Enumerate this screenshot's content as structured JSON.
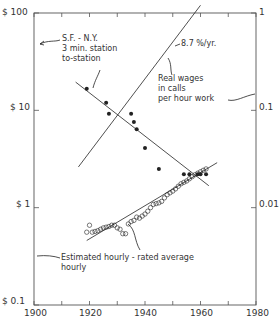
{
  "chart_data": {
    "type": "scatter",
    "title": "",
    "xlabel": "",
    "ylabel": "",
    "xlim": [
      1900,
      1980
    ],
    "ylim": [
      0.1,
      100
    ],
    "yscale": "log",
    "grid": false,
    "x_ticks": [
      1900,
      1920,
      1940,
      1960,
      1980
    ],
    "x_tick_labels": [
      "1900",
      "1920",
      "1940",
      "1960",
      "1980"
    ],
    "y_left_ticks": [
      0.1,
      1,
      10,
      100
    ],
    "y_left_tick_labels": [
      "$ 0.1",
      "$ 1",
      "$ 10",
      "$ 100"
    ],
    "y_right_ticks": [
      0.01,
      0.1,
      1
    ],
    "y_right_tick_labels": [
      "0.01",
      "0.1",
      "1"
    ],
    "y_right_note": "Right axis = left axis / 100 (real wages in calls per hour work)",
    "series": [
      {
        "name": "S.F. - N.Y. 3 min. station to-station",
        "marker": "filled-circle",
        "axis": "left",
        "points": [
          [
            1919,
            16.7
          ],
          [
            1926,
            12.0
          ],
          [
            1927,
            9.2
          ],
          [
            1935,
            9.2
          ],
          [
            1936,
            7.6
          ],
          [
            1937,
            6.4
          ],
          [
            1940,
            4.1
          ],
          [
            1945,
            2.5
          ],
          [
            1954,
            2.2
          ],
          [
            1956,
            2.2
          ],
          [
            1959,
            2.2
          ],
          [
            1960,
            2.2
          ],
          [
            1962,
            2.2
          ]
        ]
      },
      {
        "name": "Estimated hourly-rated average hourly",
        "marker": "open-circle",
        "axis": "left",
        "points": [
          [
            1919,
            0.56
          ],
          [
            1920,
            0.66
          ],
          [
            1921,
            0.56
          ],
          [
            1922,
            0.57
          ],
          [
            1923,
            0.58
          ],
          [
            1924,
            0.6
          ],
          [
            1925,
            0.62
          ],
          [
            1926,
            0.63
          ],
          [
            1927,
            0.64
          ],
          [
            1928,
            0.66
          ],
          [
            1929,
            0.66
          ],
          [
            1930,
            0.62
          ],
          [
            1931,
            0.6
          ],
          [
            1932,
            0.54
          ],
          [
            1933,
            0.54
          ],
          [
            1934,
            0.68
          ],
          [
            1935,
            0.72
          ],
          [
            1936,
            0.74
          ],
          [
            1937,
            0.8
          ],
          [
            1938,
            0.78
          ],
          [
            1939,
            0.82
          ],
          [
            1940,
            0.86
          ],
          [
            1941,
            0.92
          ],
          [
            1942,
            1.0
          ],
          [
            1943,
            1.08
          ],
          [
            1944,
            1.1
          ],
          [
            1945,
            1.12
          ],
          [
            1946,
            1.16
          ],
          [
            1947,
            1.26
          ],
          [
            1948,
            1.36
          ],
          [
            1949,
            1.42
          ],
          [
            1950,
            1.48
          ],
          [
            1951,
            1.56
          ],
          [
            1952,
            1.66
          ],
          [
            1953,
            1.76
          ],
          [
            1954,
            1.82
          ],
          [
            1955,
            1.88
          ],
          [
            1956,
            1.98
          ],
          [
            1957,
            2.08
          ],
          [
            1958,
            2.18
          ],
          [
            1959,
            2.26
          ],
          [
            1960,
            2.34
          ],
          [
            1961,
            2.42
          ],
          [
            1962,
            2.5
          ]
        ]
      }
    ],
    "fit_lines": [
      {
        "name": "call-cost-trend",
        "from": [
          1915,
          19.5
        ],
        "to": [
          1963,
          1.68
        ]
      },
      {
        "name": "wage-trend",
        "from": [
          1919,
          0.46
        ],
        "to": [
          1966,
          2.9
        ]
      },
      {
        "name": "real-wages-calls-per-hour",
        "label": "8.7 %/yr.",
        "axis": "right",
        "from": [
          1916,
          0.0262
        ],
        "to": [
          1960,
          1.2
        ]
      }
    ],
    "annotations": [
      {
        "text": "S.F. - N.Y.\n3 min. station\nto-station",
        "points_to": "call-cost-series"
      },
      {
        "text": "8.7 %/yr.",
        "points_to": "real-wages-line"
      },
      {
        "text": "Real wages\nin calls\nper hour work",
        "points_to": "right-axis"
      },
      {
        "text": "Estimated hourly - rated average\nhourly",
        "points_to": "left-axis / wage series"
      }
    ]
  },
  "axis": {
    "x_labels": [
      "1900",
      "1920",
      "1940",
      "1960",
      "1980"
    ],
    "y_left_labels": [
      "$ 100",
      "$ 10",
      "$ 1",
      "$ 0.1"
    ],
    "y_right_labels": [
      "1",
      "0.1",
      "0.01"
    ]
  },
  "annotations": {
    "sf_ny_line1": "S.F. - N.Y.",
    "sf_ny_line2": "3 min. station",
    "sf_ny_line3": "to-station",
    "rate": "8.7 %/yr.",
    "real_wages_line1": "Real wages",
    "real_wages_line2": "in calls",
    "real_wages_line3": "per hour work",
    "estimated_line1": "Estimated hourly - rated average",
    "estimated_line2": "hourly"
  },
  "colors": {
    "ink": "#222222",
    "axis": "#555555",
    "background": "#ffffff"
  }
}
